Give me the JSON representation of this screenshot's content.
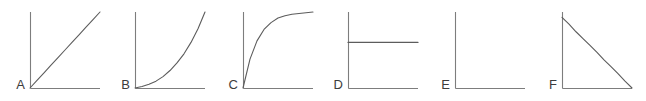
{
  "figure": {
    "width": 646,
    "height": 101,
    "background": "#ffffff",
    "axis_color": "#7d7d7d",
    "curve_color": "#5c5c5c",
    "label_color": "#3c3c3c"
  },
  "chart_data": {
    "type": "line",
    "title": "",
    "subtitle": "",
    "xlabel": "",
    "ylabel": "",
    "grid": false,
    "legend": "none",
    "axis_ticks": false,
    "tick_labels": [],
    "xlim": [
      0,
      1
    ],
    "ylim": [
      0,
      1
    ],
    "panel_count": 6,
    "panels": [
      {
        "label": "A",
        "shape": "linear-increasing",
        "description": "straight line rising from origin",
        "x": [
          0.0,
          0.1,
          0.2,
          0.3,
          0.4,
          0.5,
          0.6,
          0.7,
          0.8,
          0.9,
          1.0
        ],
        "y": [
          0.0,
          0.1,
          0.2,
          0.3,
          0.4,
          0.5,
          0.6,
          0.7,
          0.8,
          0.9,
          1.0
        ],
        "origin_px": [
          30,
          88
        ],
        "plot_width_px": 70,
        "plot_height_px": 76,
        "axis_x_end_px": 100,
        "axis_y_top_px": 12
      },
      {
        "label": "B",
        "shape": "convex-increasing",
        "description": "accelerating exponential growth curve from origin",
        "x": [
          0.0,
          0.1,
          0.2,
          0.3,
          0.4,
          0.5,
          0.6,
          0.7,
          0.8,
          0.9,
          1.0
        ],
        "y": [
          0.0,
          0.02,
          0.05,
          0.09,
          0.15,
          0.23,
          0.33,
          0.45,
          0.6,
          0.78,
          1.0
        ],
        "origin_px": [
          135,
          88
        ],
        "plot_width_px": 70,
        "plot_height_px": 76,
        "axis_x_end_px": 205,
        "axis_y_top_px": 12
      },
      {
        "label": "C",
        "shape": "concave-saturating",
        "description": "rapid rise then plateau, asymptotic approach to ceiling",
        "x": [
          0.0,
          0.1,
          0.2,
          0.3,
          0.4,
          0.5,
          0.6,
          0.7,
          0.8,
          0.9,
          1.0
        ],
        "y": [
          0.0,
          0.38,
          0.62,
          0.77,
          0.86,
          0.92,
          0.95,
          0.97,
          0.98,
          0.99,
          1.0
        ],
        "origin_px": [
          243,
          88
        ],
        "plot_width_px": 70,
        "plot_height_px": 76,
        "axis_x_end_px": 313,
        "axis_y_top_px": 12
      },
      {
        "label": "D",
        "shape": "constant",
        "description": "flat horizontal line at mid-height",
        "x": [
          0.0,
          1.0
        ],
        "y": [
          0.6,
          0.6
        ],
        "origin_px": [
          348,
          88
        ],
        "plot_width_px": 70,
        "plot_height_px": 76,
        "axis_x_end_px": 418,
        "axis_y_top_px": 12
      },
      {
        "label": "E",
        "shape": "zero",
        "description": "no visible curve, value remains at zero along the x-axis",
        "x": [
          0.0,
          1.0
        ],
        "y": [
          0.0,
          0.0
        ],
        "origin_px": [
          455,
          88
        ],
        "plot_width_px": 70,
        "plot_height_px": 76,
        "axis_x_end_px": 525,
        "axis_y_top_px": 12
      },
      {
        "label": "F",
        "shape": "linear-decreasing",
        "description": "straight line falling from high value to zero",
        "x": [
          0.0,
          0.1,
          0.2,
          0.3,
          0.4,
          0.5,
          0.6,
          0.7,
          0.8,
          0.9,
          1.0
        ],
        "y": [
          0.93,
          0.84,
          0.74,
          0.65,
          0.56,
          0.47,
          0.37,
          0.28,
          0.19,
          0.09,
          0.0
        ],
        "origin_px": [
          562,
          88
        ],
        "plot_width_px": 70,
        "plot_height_px": 76,
        "axis_x_end_px": 632,
        "axis_y_top_px": 12
      }
    ]
  }
}
